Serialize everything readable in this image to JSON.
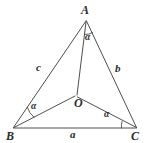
{
  "figure": {
    "kind": "geometry-diagram",
    "background_color": "#ffffff",
    "stroke_color": "#3a3a3a",
    "text_color": "#2b2b2b",
    "vertices": [
      {
        "name": "A",
        "label": "A",
        "x": 86,
        "y": 20,
        "label_x": 81,
        "label_y": 4
      },
      {
        "name": "B",
        "label": "B",
        "x": 13,
        "y": 128,
        "label_x": 6,
        "label_y": 130
      },
      {
        "name": "C",
        "label": "C",
        "x": 137,
        "y": 128,
        "label_x": 131,
        "label_y": 130
      },
      {
        "name": "O",
        "label": "O",
        "x": 76,
        "y": 96,
        "label_x": 74,
        "label_y": 97
      }
    ],
    "sides": [
      {
        "name": "side-c",
        "label": "c",
        "from": "A",
        "to": "B",
        "label_x": 36,
        "label_y": 62
      },
      {
        "name": "side-b",
        "label": "b",
        "from": "A",
        "to": "C",
        "label_x": 115,
        "label_y": 63
      },
      {
        "name": "side-a",
        "label": "a",
        "from": "B",
        "to": "C",
        "label_x": 70,
        "label_y": 129
      }
    ],
    "cevians": [
      {
        "name": "segment-AO",
        "from": "A",
        "to": "O"
      },
      {
        "name": "segment-BO",
        "from": "B",
        "to": "O"
      },
      {
        "name": "segment-CO",
        "from": "C",
        "to": "O"
      }
    ],
    "angles": [
      {
        "name": "angle-at-A",
        "label": "α",
        "label_x": 85,
        "label_y": 33,
        "between": "AO and AC"
      },
      {
        "name": "angle-at-B",
        "label": "α",
        "label_x": 31,
        "label_y": 102,
        "between": "BA and BO"
      },
      {
        "name": "angle-at-C",
        "label": "α",
        "label_x": 104,
        "label_y": 110,
        "between": "CB and CO"
      }
    ]
  }
}
